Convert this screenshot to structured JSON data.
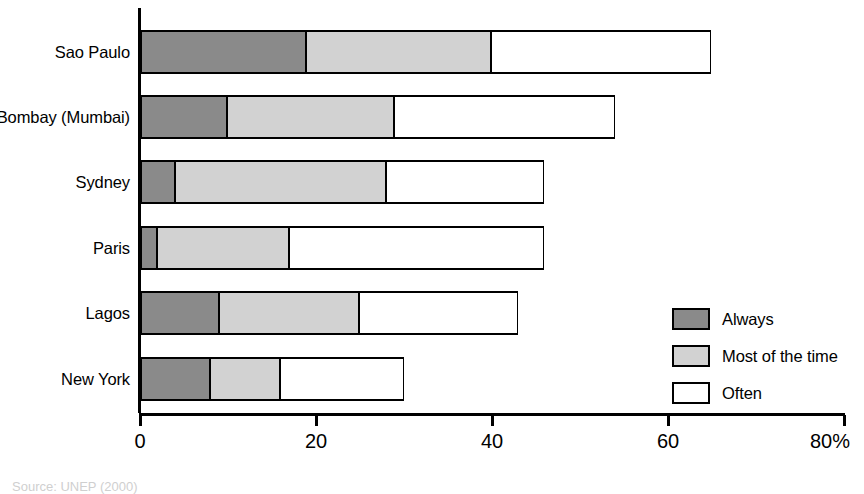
{
  "chart_data": {
    "type": "bar",
    "orientation": "horizontal",
    "stacked": true,
    "title": "",
    "xlabel": "",
    "ylabel": "",
    "xlim": [
      0,
      80
    ],
    "xticks": [
      0,
      20,
      40,
      60,
      80
    ],
    "xticklabels": [
      "0",
      "20",
      "40",
      "60",
      "80%"
    ],
    "grid": false,
    "legend_position": "right-inside",
    "categories": [
      "Sao Paulo",
      "Bombay (Mumbai)",
      "Sydney",
      "Paris",
      "Lagos",
      "New York"
    ],
    "series": [
      {
        "name": "Always",
        "color": "#8a8a8a",
        "values": [
          19,
          10,
          4,
          2,
          9,
          8
        ]
      },
      {
        "name": "Most of the time",
        "color": "#d2d2d2",
        "values": [
          21,
          19,
          24,
          15,
          16,
          8
        ]
      },
      {
        "name": "Often",
        "color": "#ffffff",
        "values": [
          25,
          25,
          18,
          29,
          18,
          14
        ]
      }
    ],
    "totals": [
      65,
      54,
      46,
      46,
      43,
      30
    ]
  },
  "axis": {
    "ticks": [
      {
        "label": "0",
        "value": 0
      },
      {
        "label": "20",
        "value": 20
      },
      {
        "label": "40",
        "value": 40
      },
      {
        "label": "60",
        "value": 60
      },
      {
        "label": "80%",
        "value": 80
      }
    ]
  },
  "legend": {
    "items": [
      {
        "label": "Always",
        "swatch": "always"
      },
      {
        "label": "Most of the time",
        "swatch": "most"
      },
      {
        "label": "Often",
        "swatch": "often"
      }
    ]
  },
  "footer": {
    "source_note": "Source: UNEP (2000)"
  }
}
